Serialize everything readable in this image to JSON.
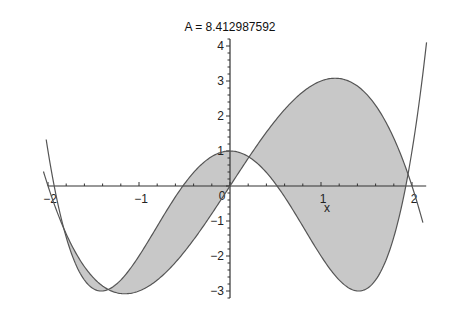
{
  "chart_data": {
    "type": "area",
    "title": "A = 8.412987592",
    "xlabel": "x",
    "ylabel": "",
    "xlim": [
      -2.0,
      2.2
    ],
    "ylim": [
      -3.2,
      4.2
    ],
    "x_ticks": [
      -2,
      -1,
      0,
      1,
      2
    ],
    "x_tick_labels": [
      "−2",
      "−1",
      "0",
      "1",
      "2"
    ],
    "y_ticks": [
      -3,
      -2,
      -1,
      1,
      2,
      3,
      4
    ],
    "y_tick_labels": [
      "−3",
      "−2",
      "−1",
      "1",
      "2",
      "3",
      "4"
    ],
    "minor_tick_step": 0.2,
    "grid": false,
    "legend": false,
    "series": [
      {
        "name": "f(x) = 4x - x^3",
        "coefficients_high_to_low": [
          -1,
          0,
          4,
          0
        ],
        "domain": [
          -2.05,
          2.12
        ],
        "color": "#555555"
      },
      {
        "name": "g(x) = x^4 - 4x^2 + 1",
        "coefficients_high_to_low": [
          1,
          0,
          -4,
          0,
          1
        ],
        "domain": [
          -2.02,
          2.16
        ],
        "color": "#555555"
      }
    ],
    "shaded_region": {
      "between": [
        "f(x) = 4x - x^3",
        "g(x) = x^4 - 4x^2 + 1"
      ],
      "x_from": -1.82,
      "x_to": 1.96,
      "color": "#c8c8c8",
      "area": 8.412987592
    }
  },
  "layout": {
    "origin_px": [
      230,
      186
    ],
    "px_per_unit_x": 91,
    "px_per_unit_y": 35
  }
}
